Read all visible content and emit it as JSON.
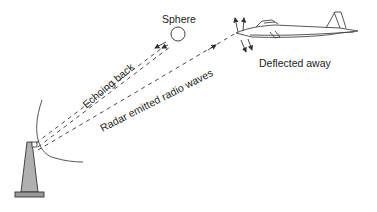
{
  "diagram": {
    "labels": {
      "sphere": "Sphere",
      "echoing_back": "Echoing back",
      "radar_waves": "Radar emitted radio waves",
      "deflected": "Deflected away"
    },
    "elements": {
      "radar_tower": "radar-tower",
      "sphere": "sphere",
      "aircraft": "stealth-aircraft"
    },
    "colors": {
      "line": "#333333",
      "tower_fill": "#b0b0b0",
      "base_fill": "#999999",
      "background": "#ffffff"
    }
  }
}
